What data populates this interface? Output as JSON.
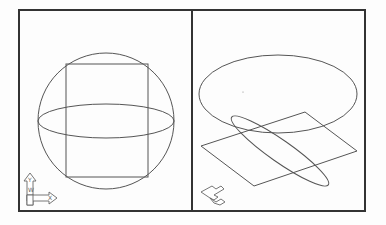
{
  "app": {
    "type": "cad-viewports",
    "layout": "two-vertical-viewports"
  },
  "viewports": [
    {
      "id": "left",
      "view": "front",
      "active": false,
      "objects": [
        {
          "type": "sphere-outline-circle"
        },
        {
          "type": "equator-ellipse"
        },
        {
          "type": "rectangle"
        }
      ],
      "ucs_icon": {
        "x_label": "X",
        "y_label": "Y",
        "w_label": "W"
      }
    },
    {
      "id": "right",
      "view": "isometric",
      "active": true,
      "objects": [
        {
          "type": "ellipse-top"
        },
        {
          "type": "plane-parallelogram"
        },
        {
          "type": "tilted-ellipse"
        }
      ],
      "ucs_icon": {
        "style": "isometric"
      }
    }
  ],
  "colors": {
    "background": "#fdfdfd",
    "frame": "#333333",
    "geometry": "#555555"
  }
}
